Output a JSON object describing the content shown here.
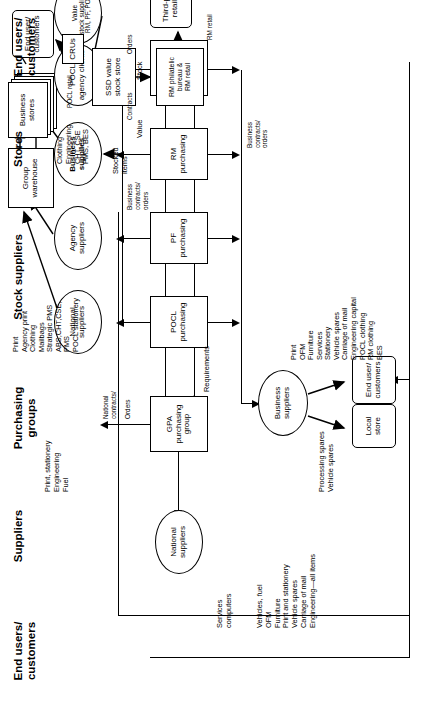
{
  "diagram": {
    "columns": [
      {
        "id": "end-users-left",
        "label": "End users/\ncustomers"
      },
      {
        "id": "suppliers",
        "label": "Suppliers"
      },
      {
        "id": "purchasing-groups",
        "label": "Purchasing\ngroups"
      },
      {
        "id": "stock-suppliers",
        "label": "Stock suppliers"
      },
      {
        "id": "stores",
        "label": "Stores"
      },
      {
        "id": "end-users-right",
        "label": "End users/\ncustomers"
      }
    ],
    "nodes": {
      "national_suppliers_lower": "National\nsuppliers",
      "national_suppliers_upper": "National\nsuppliers",
      "agency_suppliers": "Agency\nsuppliers",
      "business_supplies": "Business\nsupplies",
      "business_suppliers": "Business\nsuppliers",
      "pocl_agency_clients": "POCL\nagency clients",
      "value_stock_suppliers": "Value\nstock suppliers",
      "value_stock_suppliers_sub": "RM, PF, POCL",
      "gpa_purchasing_group": "GPA\npurchasing\ngroup",
      "pocl_purchasing": "POCL\npurchasing",
      "pf_purchasing": "PF\npurchasing",
      "rm_purchasing": "RM\npurchasing",
      "group_services_purchasing": "Group\nservices\npurchasing",
      "group_warehouse": "Group\nwarehouse",
      "business_stores": "Business\nstores",
      "ssd_value_stock_store": "SSD value\nstock store",
      "rm_philatelic": "RM philatelic\nbureau &\nRM retail",
      "crus": "CRUs",
      "end_user_customers_top": "End user/\ncustomers",
      "third_party_retailers": "Third-party\nretailers",
      "local_store": "Local\nstore",
      "end_user_customers_bottom": "End user/\ncustomers"
    },
    "annotations": {
      "services_computers": "Services\ncomputers",
      "lower_items_list": "Vehicles, fuel\nOFM\nFurniture\nPrint and stationery\nVehicle spares\nCarriage of mail\nEngineering—all items",
      "print_stationery_engineering_fuel": "Print, stationery\nEngineering\nFuel",
      "stores_items_list": "Print\nAgency print\nClothing\nMailbags\nStrategic PMS\nABS,CHT,CSE,\nPMS\nPOCL stationery",
      "clothing_engineering_list": "Clothing\nEngineering\nCHT, CSE\nPMS, BES",
      "stocked_items": "Stocked items",
      "pocl_retail": "POCL retail",
      "rm_retail": "RM retail",
      "value": "Value",
      "stock": "Stock",
      "contracts": "Contracts",
      "orders_right": "Orders",
      "national_contracts": "National\ncontracts/",
      "orders_left": "Orders",
      "requirements": "Requirements",
      "business_contracts_orders_upper": "Business\ncontracts/",
      "orders_upper": "orders",
      "business_contracts_orders_lower": "Business\ncontracts/\norders",
      "processing_vehicle_spares": "Processing spares\nVehicle spares",
      "bottom_items_list": "Print\nOFM\nFurniture\nServices\nStationery\nVehicle spares\nCarriage of mail\nEngineering capital\nPOCL clothing\nRM clothing\nBES"
    },
    "colors": {
      "line": "#000000",
      "background": "#ffffff"
    }
  }
}
